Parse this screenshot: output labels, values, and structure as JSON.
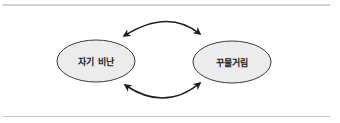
{
  "diagram": {
    "nodes": [
      {
        "id": "self-criticism",
        "label": "자기 비난"
      },
      {
        "id": "procrastination",
        "label": "꾸물거림"
      }
    ],
    "edges": [
      {
        "from": "self-criticism",
        "to": "procrastination",
        "type": "bidirectional",
        "position": "top"
      },
      {
        "from": "procrastination",
        "to": "self-criticism",
        "type": "bidirectional",
        "position": "bottom"
      }
    ],
    "colors": {
      "node_fill": "#ececec",
      "node_stroke": "#3a3a3a",
      "arrow": "#1e1e1e",
      "rule": "#c8c8c8"
    }
  }
}
